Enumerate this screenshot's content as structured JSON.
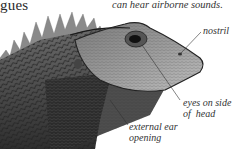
{
  "page": {
    "heading_fragment": "gues",
    "caption_fragment": "can hear airborne sounds."
  },
  "illustration": {
    "subject": "lizard-head",
    "labels": [
      {
        "id": "nostril",
        "text": "nostril"
      },
      {
        "id": "eyes",
        "line1": "eyes on side",
        "line2": "of  head"
      },
      {
        "id": "ear",
        "line1": "external ear",
        "line2": "opening"
      }
    ]
  }
}
